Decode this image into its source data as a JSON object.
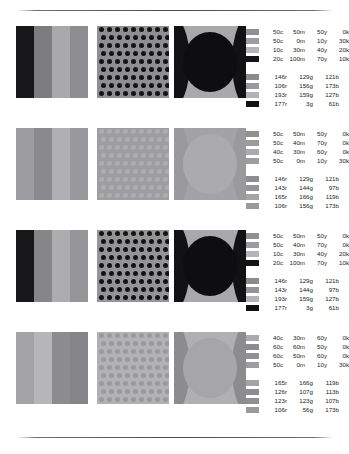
{
  "page": {
    "background": "#ffffff",
    "rules": {
      "top_label": "top-divider",
      "bottom_label": "bottom-divider"
    }
  },
  "rows": [
    {
      "id": "row-1",
      "contrast": "high",
      "panels": [
        {
          "type": "bands",
          "name": "panel-vertical-bands",
          "colors": [
            "#17171a",
            "#7d7d80",
            "#a9a9ab",
            "#8e8e90"
          ]
        },
        {
          "type": "dots",
          "name": "panel-dot-grid",
          "background": "#8f8f91",
          "dot_color": "#141417",
          "dot_size": 5,
          "columns": 9,
          "rows": 9
        },
        {
          "type": "scene",
          "name": "panel-ellipse",
          "background": "#a9a9ab",
          "shape_color": "#121215",
          "ellipse_color": "#0e0e11"
        }
      ],
      "cmyk": [
        {
          "swatch": "#909092",
          "c": "50c",
          "m": "50m",
          "y": "50y",
          "k": "0k"
        },
        {
          "swatch": "#9d9d9f",
          "c": "50c",
          "m": "0m",
          "y": "10y",
          "k": "30k"
        },
        {
          "swatch": "#b4b4b6",
          "c": "10c",
          "m": "30m",
          "y": "40y",
          "k": "20k"
        },
        {
          "swatch": "#141417",
          "c": "20c",
          "m": "100m",
          "y": "70y",
          "k": "10k"
        }
      ],
      "rgb": [
        {
          "swatch": "#8b8b8d",
          "r": "146r",
          "g": "129g",
          "b": "121b"
        },
        {
          "swatch": "#999a9c",
          "r": "106r",
          "g": "156g",
          "b": "173b"
        },
        {
          "swatch": "#b3b3b5",
          "r": "193r",
          "g": "159g",
          "b": "127b"
        },
        {
          "swatch": "#111114",
          "r": "177r",
          "g": "3g",
          "b": "61b"
        }
      ]
    },
    {
      "id": "row-2",
      "contrast": "low",
      "panels": [
        {
          "type": "bands",
          "name": "panel-vertical-bands",
          "colors": [
            "#9d9d9f",
            "#8a8a8c",
            "#b0b0b2",
            "#99999b"
          ]
        },
        {
          "type": "dots",
          "name": "panel-dot-grid",
          "background": "#9e9ea0",
          "dot_color": "#adadaf",
          "dot_size": 5,
          "columns": 9,
          "rows": 9
        },
        {
          "type": "scene",
          "name": "panel-ellipse",
          "background": "#a3a3a5",
          "shape_color": "#9a9a9c",
          "ellipse_color": "#ababad"
        }
      ],
      "cmyk": [
        {
          "swatch": "#90908f",
          "c": "50c",
          "m": "50m",
          "y": "50y",
          "k": "0k"
        },
        {
          "swatch": "#9b9b9d",
          "c": "50c",
          "m": "40m",
          "y": "70y",
          "k": "0k"
        },
        {
          "swatch": "#aaaaac",
          "c": "40c",
          "m": "30m",
          "y": "60y",
          "k": "0k"
        },
        {
          "swatch": "#9d9d9f",
          "c": "50c",
          "m": "0m",
          "y": "10y",
          "k": "30k"
        }
      ],
      "rgb": [
        {
          "swatch": "#8e8e90",
          "r": "146r",
          "g": "129g",
          "b": "121b"
        },
        {
          "swatch": "#949496",
          "r": "143r",
          "g": "144g",
          "b": "97b"
        },
        {
          "swatch": "#a4a4a6",
          "r": "165r",
          "g": "166g",
          "b": "119b"
        },
        {
          "swatch": "#999a9c",
          "r": "106r",
          "g": "156g",
          "b": "173b"
        }
      ]
    },
    {
      "id": "row-3",
      "contrast": "high",
      "panels": [
        {
          "type": "bands",
          "name": "panel-vertical-bands",
          "colors": [
            "#17171a",
            "#868688",
            "#adadaf",
            "#969698"
          ]
        },
        {
          "type": "dots",
          "name": "panel-dot-grid",
          "background": "#959597",
          "dot_color": "#141417",
          "dot_size": 5,
          "columns": 9,
          "rows": 9
        },
        {
          "type": "scene",
          "name": "panel-ellipse",
          "background": "#a9a9ab",
          "shape_color": "#121215",
          "ellipse_color": "#0e0e11"
        }
      ],
      "cmyk": [
        {
          "swatch": "#909092",
          "c": "50c",
          "m": "50m",
          "y": "50y",
          "k": "0k"
        },
        {
          "swatch": "#9b9b9d",
          "c": "50c",
          "m": "40m",
          "y": "70y",
          "k": "0k"
        },
        {
          "swatch": "#b4b4b6",
          "c": "10c",
          "m": "30m",
          "y": "40y",
          "k": "20k"
        },
        {
          "swatch": "#141417",
          "c": "20c",
          "m": "100m",
          "y": "70y",
          "k": "10k"
        }
      ],
      "rgb": [
        {
          "swatch": "#8b8b8d",
          "r": "146r",
          "g": "129g",
          "b": "121b"
        },
        {
          "swatch": "#949496",
          "r": "143r",
          "g": "144g",
          "b": "97b"
        },
        {
          "swatch": "#b3b3b5",
          "r": "193r",
          "g": "159g",
          "b": "127b"
        },
        {
          "swatch": "#111114",
          "r": "177r",
          "g": "3g",
          "b": "61b"
        }
      ]
    },
    {
      "id": "row-4",
      "contrast": "low",
      "panels": [
        {
          "type": "bands",
          "name": "panel-vertical-bands",
          "colors": [
            "#a4a4a6",
            "#b6b6b8",
            "#8c8c8e",
            "#858587"
          ]
        },
        {
          "type": "dots",
          "name": "panel-dot-grid",
          "background": "#b2b2b4",
          "dot_color": "#9a9a9c",
          "dot_size": 5,
          "columns": 9,
          "rows": 9
        },
        {
          "type": "scene",
          "name": "panel-ellipse",
          "background": "#b0b0b2",
          "shape_color": "#8c8c8e",
          "ellipse_color": "#a6a6a8"
        }
      ],
      "cmyk": [
        {
          "swatch": "#aaaaac",
          "c": "40c",
          "m": "30m",
          "y": "60y",
          "k": "0k"
        },
        {
          "swatch": "#8b8b8d",
          "c": "60c",
          "m": "60m",
          "y": "50y",
          "k": "0k"
        },
        {
          "swatch": "#919193",
          "c": "60c",
          "m": "50m",
          "y": "60y",
          "k": "0k"
        },
        {
          "swatch": "#9d9d9f",
          "c": "50c",
          "m": "0m",
          "y": "10y",
          "k": "30k"
        }
      ],
      "rgb": [
        {
          "swatch": "#a4a4a6",
          "r": "165r",
          "g": "166g",
          "b": "119b"
        },
        {
          "swatch": "#8d8d8f",
          "r": "126r",
          "g": "107g",
          "b": "113b"
        },
        {
          "swatch": "#909092",
          "r": "123r",
          "g": "123g",
          "b": "107b"
        },
        {
          "swatch": "#999a9c",
          "r": "106r",
          "g": "56g",
          "b": "173b"
        }
      ]
    }
  ]
}
